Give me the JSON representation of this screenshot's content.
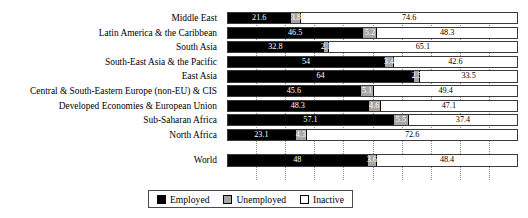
{
  "chart_data": {
    "type": "bar",
    "orientation": "horizontal",
    "stacked": true,
    "normalized_percent": true,
    "title": "",
    "subtitle": "",
    "xlabel": "",
    "ylabel": "",
    "xlim": [
      0,
      100
    ],
    "grid": true,
    "gridline_values": [
      10,
      20,
      30,
      40,
      50,
      60,
      70,
      80,
      90
    ],
    "legend_position": "bottom",
    "categories": [
      "Middle East",
      "Latin America & the Caribbean",
      "South Asia",
      "South-East Asia & the Pacific",
      "East Asia",
      "Central & South-Eastern Europe (non-EU) & CIS",
      "Developed Economies & European Union",
      "Sub-Saharan Africa",
      "North Africa",
      "World"
    ],
    "series": [
      {
        "name": "Employed",
        "color": "#000000",
        "values": [
          21.6,
          46.5,
          32.8,
          54,
          64,
          45.6,
          48.3,
          57.1,
          23.1,
          48
        ]
      },
      {
        "name": "Unemployed",
        "color": "#A6A6A6",
        "values": [
          3.8,
          5.2,
          2.1,
          3.4,
          2.5,
          5.1,
          4.6,
          5.5,
          4.3,
          3.6
        ]
      },
      {
        "name": "Inactive",
        "color": "#FFFFFF",
        "values": [
          74.6,
          48.3,
          65.1,
          42.6,
          33.5,
          49.4,
          47.1,
          37.4,
          72.6,
          48.4
        ]
      }
    ],
    "value_labels": [
      [
        "21.6",
        "3.8",
        "74.6"
      ],
      [
        "46.5",
        "5.2",
        "48.3"
      ],
      [
        "32.8",
        "2.1",
        "65.1"
      ],
      [
        "54",
        "3.4",
        "42.6"
      ],
      [
        "64",
        "2.5",
        "33.5"
      ],
      [
        "45.6",
        "5.1",
        "49.4"
      ],
      [
        "48.3",
        "4.6",
        "47.1"
      ],
      [
        "57.1",
        "5.5",
        "37.4"
      ],
      [
        "23.1",
        "4.3",
        "72.6"
      ],
      [
        "48",
        "3.6",
        "48.4"
      ]
    ]
  },
  "legend": {
    "items": [
      {
        "label": "Employed"
      },
      {
        "label": "Unemployed"
      },
      {
        "label": "Inactive"
      }
    ]
  }
}
